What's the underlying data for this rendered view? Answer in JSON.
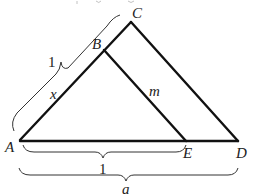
{
  "diagram": {
    "points": {
      "A": {
        "label": "A"
      },
      "B": {
        "label": "B"
      },
      "C": {
        "label": "C"
      },
      "D": {
        "label": "D"
      },
      "E": {
        "label": "E"
      }
    },
    "segments": [
      {
        "from": "A",
        "to": "C"
      },
      {
        "from": "C",
        "to": "D"
      },
      {
        "from": "A",
        "to": "D"
      },
      {
        "from": "B",
        "to": "E"
      }
    ],
    "segment_labels": {
      "AB": "x",
      "BE": "m"
    },
    "braces": {
      "AC": "1",
      "AE": "1",
      "AD": "a"
    }
  }
}
